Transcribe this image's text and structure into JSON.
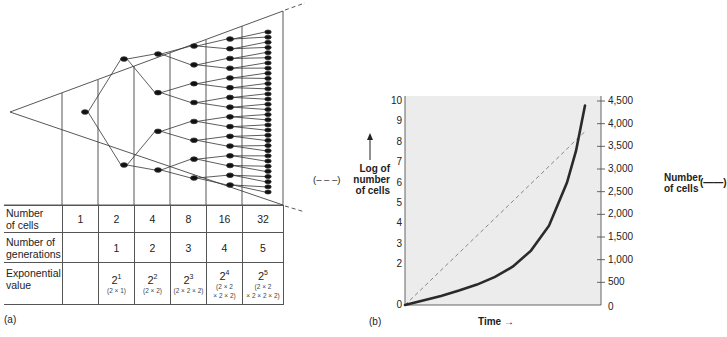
{
  "panel_a": {
    "label": "(a)",
    "table": {
      "rows": [
        {
          "header": "Number of cells",
          "header_lines": [
            "Number",
            "of cells"
          ],
          "cells": [
            "1",
            "2",
            "4",
            "8",
            "16",
            "32"
          ]
        },
        {
          "header": "Number of generations",
          "header_lines": [
            "Number of",
            "generations"
          ],
          "cells": [
            "",
            "1",
            "2",
            "3",
            "4",
            "5"
          ]
        },
        {
          "header": "Exponential value",
          "header_lines": [
            "Exponential",
            "value"
          ],
          "cells": [
            {
              "base": "",
              "exp": "",
              "note": ""
            },
            {
              "base": "2",
              "exp": "1",
              "note": "(2 × 1)"
            },
            {
              "base": "2",
              "exp": "2",
              "note": "(2 × 2)"
            },
            {
              "base": "2",
              "exp": "3",
              "note": "(2 × 2 × 2)"
            },
            {
              "base": "2",
              "exp": "4",
              "note": "(2 × 2 × 2 × 2)",
              "note_lines": [
                "(2 × 2",
                "× 2 × 2)"
              ]
            },
            {
              "base": "2",
              "exp": "5",
              "note": "(2 × 2 × 2 × 2 × 2)",
              "note_lines": [
                "(2 × 2",
                "× 2 × 2 × 2)"
              ]
            }
          ]
        }
      ]
    },
    "diagram": {
      "description": "Binary fission tree inside a triangle: 1 → 2 → 4 → 8 → 16 → 32 cells",
      "generations": [
        1,
        2,
        4,
        8,
        16,
        32
      ]
    }
  },
  "panel_b": {
    "label": "(b)",
    "left_axis": {
      "title_lines": [
        "Log of",
        "number",
        "of cells"
      ],
      "legend_marker": "(– – –)",
      "ticks": [
        "10",
        "9",
        "8",
        "7",
        "6",
        "5",
        "4",
        "3",
        "2",
        "0"
      ]
    },
    "right_axis": {
      "title_lines": [
        "Number",
        "of cells"
      ],
      "legend_marker": "(——)",
      "ticks": [
        "4,500",
        "4,000",
        "3,500",
        "3,000",
        "2,500",
        "2,000",
        "1,500",
        "1,000",
        "500",
        "0"
      ]
    },
    "x_axis": {
      "title": "Time",
      "arrow": "→"
    }
  },
  "chart_data": {
    "type": "line",
    "title": "",
    "xlabel": "Time",
    "ylabel": "Log of number of cells",
    "y2label": "Number of cells",
    "ylim": [
      0,
      10
    ],
    "y2lim": [
      0,
      4500
    ],
    "y_ticks": [
      0,
      2,
      3,
      4,
      5,
      6,
      7,
      8,
      9,
      10
    ],
    "y2_ticks": [
      0,
      500,
      1000,
      1500,
      2000,
      2500,
      3000,
      3500,
      4000,
      4500
    ],
    "grid": false,
    "legend_position": "axis titles",
    "x": [
      0,
      0.1,
      0.2,
      0.3,
      0.4,
      0.5,
      0.6,
      0.7,
      0.8,
      0.9,
      0.95,
      1.0
    ],
    "series": [
      {
        "name": "Log of number of cells",
        "style": "dashed",
        "axis": "left",
        "values": [
          0,
          0.85,
          1.7,
          2.55,
          3.4,
          4.25,
          5.1,
          5.95,
          6.8,
          7.65,
          8.1,
          8.5
        ]
      },
      {
        "name": "Number of cells",
        "style": "solid",
        "axis": "right",
        "values": [
          0,
          100,
          200,
          320,
          450,
          620,
          850,
          1200,
          1750,
          2700,
          3400,
          4400
        ]
      }
    ]
  }
}
